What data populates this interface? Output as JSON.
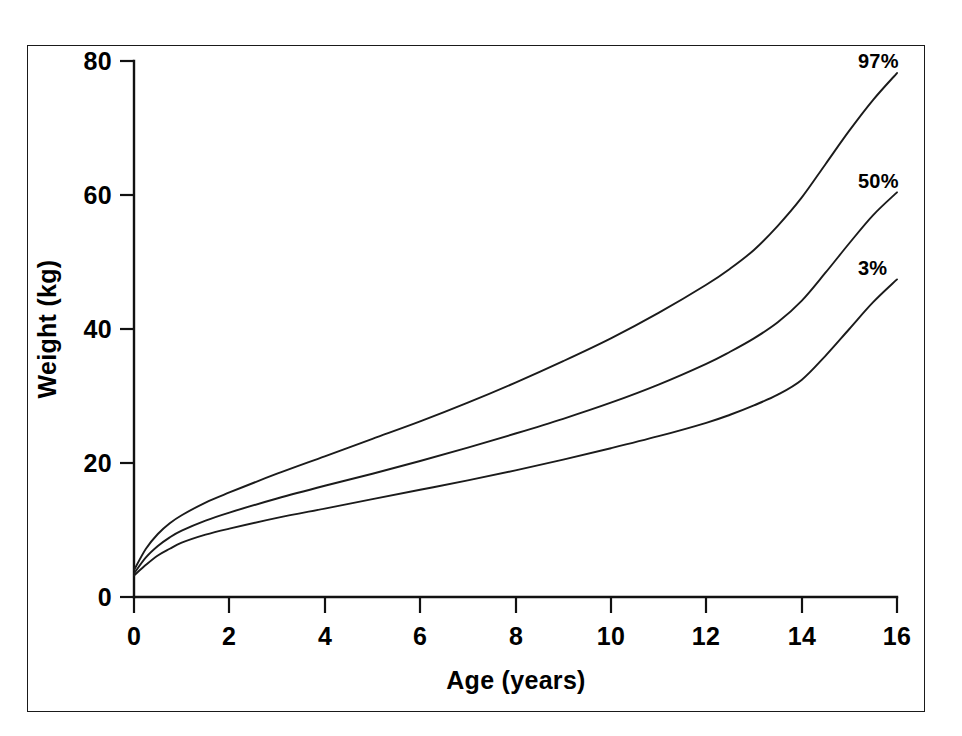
{
  "figure": {
    "background_color": "#ffffff",
    "border_color": "#1a1a1a",
    "ink_color": "#111111"
  },
  "chart_data": {
    "type": "line",
    "title": "",
    "subtitle": "",
    "xlabel": "Age (years)",
    "ylabel": "Weight (kg)",
    "xlim": [
      0,
      16
    ],
    "ylim": [
      0,
      80
    ],
    "xticks": [
      0,
      2,
      4,
      6,
      8,
      10,
      12,
      14,
      16
    ],
    "xticklabels": [
      "0",
      "2",
      "4",
      "6",
      "8",
      "10",
      "12",
      "14",
      "16"
    ],
    "yticks": [
      0,
      20,
      40,
      60,
      80
    ],
    "yticklabels": [
      "0",
      "20",
      "40",
      "60",
      "80"
    ],
    "grid": false,
    "legend_position": "inline-right-of-curve-end",
    "line_color": "#1b1b1b",
    "x": [
      0,
      0.25,
      0.5,
      0.75,
      1,
      1.5,
      2,
      3,
      4,
      5,
      6,
      7,
      8,
      9,
      10,
      11,
      12,
      12.5,
      13,
      13.5,
      14,
      14.5,
      15,
      15.5,
      16
    ],
    "series": [
      {
        "name": "97%",
        "label": "97%",
        "values": [
          4.0,
          7.2,
          9.4,
          11.0,
          12.2,
          14.1,
          15.6,
          18.4,
          21.0,
          23.6,
          26.2,
          29.0,
          32.0,
          35.2,
          38.6,
          42.4,
          46.6,
          49.0,
          51.8,
          55.4,
          59.6,
          64.6,
          69.6,
          74.2,
          78.2
        ]
      },
      {
        "name": "50%",
        "label": "50%",
        "values": [
          3.5,
          5.9,
          7.6,
          8.9,
          9.9,
          11.4,
          12.6,
          14.7,
          16.6,
          18.4,
          20.3,
          22.3,
          24.4,
          26.6,
          29.0,
          31.7,
          34.8,
          36.6,
          38.6,
          41.0,
          44.2,
          48.4,
          52.8,
          57.0,
          60.4
        ]
      },
      {
        "name": "3%",
        "label": "3%",
        "values": [
          3.2,
          4.8,
          6.2,
          7.2,
          8.1,
          9.3,
          10.2,
          11.8,
          13.2,
          14.6,
          16.0,
          17.4,
          18.9,
          20.5,
          22.2,
          24.0,
          26.0,
          27.2,
          28.6,
          30.2,
          32.4,
          36.0,
          40.0,
          44.0,
          47.4
        ]
      }
    ]
  }
}
